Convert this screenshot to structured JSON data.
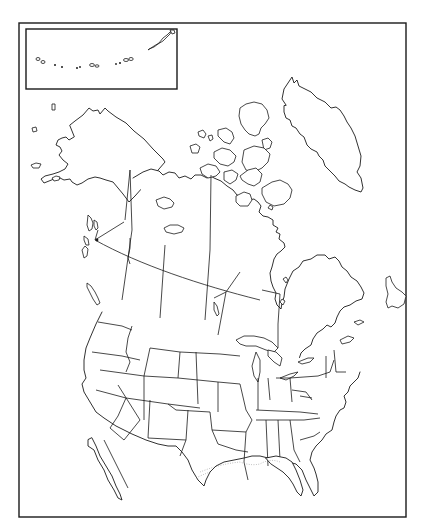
{
  "map": {
    "type": "blank outline map",
    "region": "North America",
    "regions_shown": [
      "Alaska",
      "Canada",
      "Greenland",
      "United States",
      "Northern Mexico",
      "Aleutian Islands (inset)"
    ],
    "inset": {
      "name": "aleutian-islands-inset",
      "content": "Aleutian Islands"
    },
    "labels": [],
    "colors": {
      "line": "#1a1a1a",
      "background": "#ffffff"
    }
  }
}
